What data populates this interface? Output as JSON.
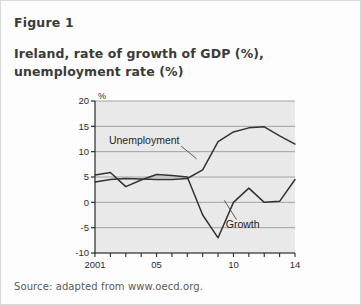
{
  "figure": {
    "label": "Figure 1",
    "title_line1": "Ireland, rate of growth of GDP (%),",
    "title_line2": "unemployment rate (%)",
    "source": "Source: adapted from www.oecd.org."
  },
  "chart_data": {
    "type": "line",
    "title": "Ireland, rate of growth of GDP (%), unemployment rate (%)",
    "xlabel": "",
    "ylabel": "",
    "yunit": "%",
    "grid": true,
    "legend_position": "inline-annotations",
    "xlim": [
      2001,
      2014
    ],
    "ylim": [
      -10,
      20
    ],
    "yticks": [
      20,
      15,
      10,
      5,
      0,
      -5,
      -10
    ],
    "ytick_labels": [
      "20",
      "15",
      "10",
      "5",
      "0",
      "-5",
      "-10"
    ],
    "x": [
      2001,
      2002,
      2003,
      2004,
      2005,
      2006,
      2007,
      2008,
      2009,
      2010,
      2011,
      2012,
      2013,
      2014
    ],
    "xticks": [
      2001,
      2005,
      2010,
      2014
    ],
    "xtick_labels": [
      "2001",
      "05",
      "10",
      "14"
    ],
    "series": [
      {
        "name": "Unemployment",
        "values": [
          4.0,
          4.5,
          4.7,
          4.6,
          4.5,
          4.5,
          4.7,
          6.4,
          12.0,
          13.9,
          14.7,
          14.9,
          13.1,
          11.5
        ]
      },
      {
        "name": "Growth",
        "values": [
          5.4,
          5.9,
          3.1,
          4.4,
          5.5,
          5.3,
          5.0,
          -2.5,
          -7.0,
          0.0,
          2.8,
          0.0,
          0.2,
          4.5
        ]
      }
    ],
    "annotations": [
      {
        "text": "Unemployment",
        "x": 2004.2,
        "y": 12.2
      },
      {
        "text": "Growth",
        "x": 2010.6,
        "y": -4.4
      }
    ]
  }
}
